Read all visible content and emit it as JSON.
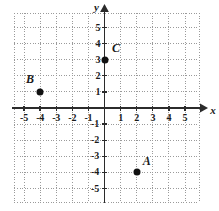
{
  "chart_data": {
    "type": "scatter",
    "title": "",
    "xlabel": "x",
    "ylabel": "y",
    "grid": true,
    "legend": "none",
    "xlim": [
      -5.6,
      5.9
    ],
    "ylim": [
      -5.9,
      5.9
    ],
    "x_ticks": [
      -5,
      -4,
      -3,
      -2,
      -1,
      1,
      2,
      3,
      4,
      5
    ],
    "y_ticks": [
      5,
      4,
      3,
      2,
      1,
      -1,
      -2,
      -3,
      -4,
      -5
    ],
    "x_tick_labels": [
      "-5",
      "-4",
      "-3",
      "-2",
      "-1",
      "1",
      "2",
      "3",
      "4",
      "5"
    ],
    "y_tick_labels": [
      "5",
      "4",
      "3",
      "2",
      "1",
      "-1",
      "-2",
      "-3",
      "-4",
      "-5"
    ],
    "points": [
      {
        "label": "A",
        "x": 2,
        "y": -4,
        "label_dx": 0.62,
        "label_dy": 0.72
      },
      {
        "label": "B",
        "x": -4,
        "y": 1,
        "label_dx": -0.62,
        "label_dy": 0.78
      },
      {
        "label": "C",
        "x": 0,
        "y": 3,
        "label_dx": 0.72,
        "label_dy": 0.75
      }
    ],
    "colors": {
      "point": "#111111",
      "axis": "#2b2b2b",
      "grid": "#9a9a9a",
      "text": "#1a1a1a",
      "background": "#ffffff"
    }
  },
  "figure": {
    "x_axis_label": "x",
    "y_axis_label": "y"
  }
}
